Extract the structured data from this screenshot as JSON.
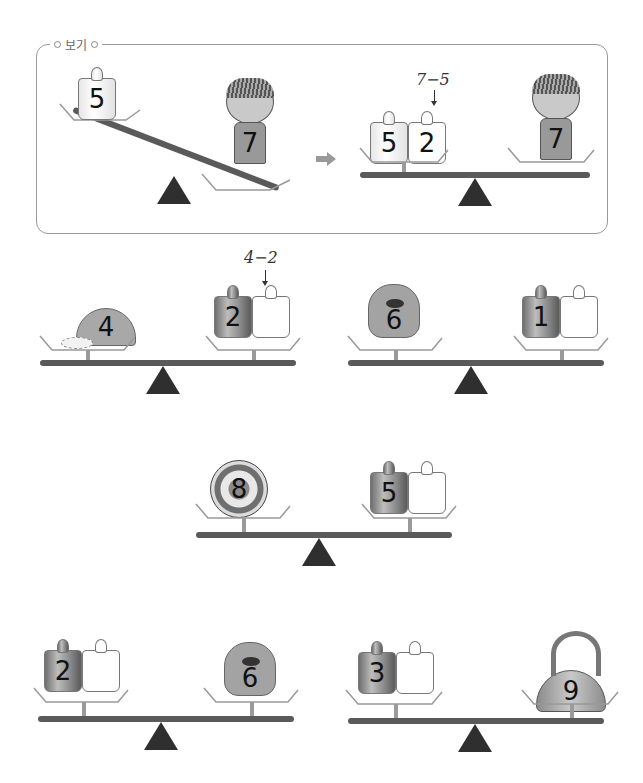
{
  "example": {
    "label": "보기",
    "before": {
      "left_weight": "5",
      "right_object": "girl",
      "right_value": "7",
      "tilt": "right-down"
    },
    "arrow_icon": "right-arrow",
    "after": {
      "left_weights": [
        "5",
        "2"
      ],
      "annotation": "7−5",
      "right_object": "girl",
      "right_value": "7"
    }
  },
  "problems": [
    {
      "id": 1,
      "left": {
        "object": "cap",
        "value": "4"
      },
      "right": {
        "weights": [
          "2",
          ""
        ]
      },
      "annotation": "4−2"
    },
    {
      "id": 2,
      "left": {
        "object": "monster",
        "value": "6"
      },
      "right": {
        "weights": [
          "1",
          ""
        ]
      }
    },
    {
      "id": 3,
      "left": {
        "object": "soccer-ball",
        "value": "8"
      },
      "right": {
        "weights": [
          "5",
          ""
        ]
      }
    },
    {
      "id": 4,
      "left": {
        "weights": [
          "2",
          ""
        ]
      },
      "right": {
        "object": "monster",
        "value": "6"
      }
    },
    {
      "id": 5,
      "left": {
        "weights": [
          "3",
          ""
        ]
      },
      "right": {
        "object": "kettle",
        "value": "9"
      }
    }
  ],
  "colors": {
    "beam": "#5a5a5a",
    "fulcrum": "#2f2f2f",
    "border": "#9a9a9a"
  }
}
